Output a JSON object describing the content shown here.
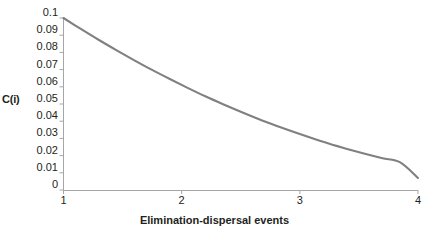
{
  "chart_data": {
    "type": "line",
    "title": "",
    "xlabel": "Elimination-dispersal events",
    "ylabel": "C(i)",
    "xlim": [
      1,
      4
    ],
    "ylim": [
      0,
      0.1
    ],
    "grid": false,
    "legend": "none",
    "line_color": "#808080",
    "axis_color": "#a6a6a6",
    "x_ticks": [
      "1",
      "2",
      "3",
      "4"
    ],
    "x_tick_values": [
      1,
      2,
      3,
      4
    ],
    "y_ticks": [
      "0.1",
      "0.09",
      "0.08",
      "0.07",
      "0.06",
      "0.05",
      "0.04",
      "0.03",
      "0.02",
      "0.01",
      "0"
    ],
    "y_tick_values": [
      0.1,
      0.09,
      0.08,
      0.07,
      0.06,
      0.05,
      0.04,
      0.03,
      0.02,
      0.01,
      0
    ],
    "series": [
      {
        "name": "C(i)",
        "x": [
          1,
          1.15,
          1.3,
          1.45,
          1.6,
          1.75,
          1.9,
          2.05,
          2.2,
          2.35,
          2.5,
          2.65,
          2.8,
          2.95,
          3.1,
          3.25,
          3.4,
          3.55,
          3.7,
          3.85,
          4
        ],
        "values": [
          0.1,
          0.0935,
          0.0872,
          0.0812,
          0.0754,
          0.0698,
          0.0645,
          0.0594,
          0.0545,
          0.0499,
          0.0455,
          0.0413,
          0.0374,
          0.0337,
          0.0302,
          0.0269,
          0.0239,
          0.0211,
          0.0185,
          0.0161,
          0.007
        ]
      }
    ]
  },
  "axes": {
    "y_label": "C(i)",
    "x_label": "Elimination-dispersal events"
  }
}
